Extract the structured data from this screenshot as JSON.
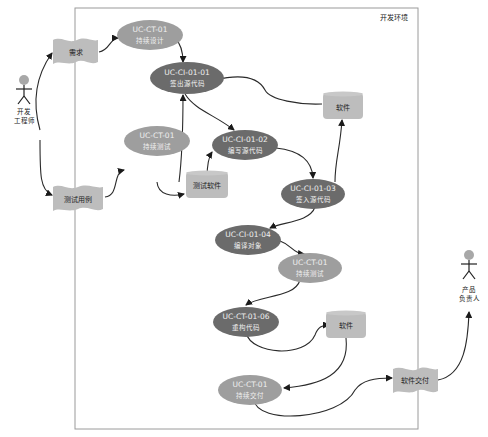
{
  "environment_label": "开发环境",
  "colors": {
    "dark_node": "#6b6b6b",
    "light_node": "#9e9e9e",
    "artifact": "#bdbdbd",
    "actor_head": "#a8a8a8",
    "frame": "#9a9a9a"
  },
  "actors": [
    {
      "id": "dev",
      "line1": "开发",
      "line2": "工程师"
    },
    {
      "id": "po",
      "line1": "产品",
      "line2": "负责人"
    }
  ],
  "documents": [
    {
      "id": "req",
      "label": "需求"
    },
    {
      "id": "testcase",
      "label": "测试用例"
    },
    {
      "id": "delivery",
      "label": "软件交付"
    }
  ],
  "artifacts": [
    {
      "id": "sw1",
      "label": "软件"
    },
    {
      "id": "testsw",
      "label": "测试软件"
    },
    {
      "id": "sw2",
      "label": "软件"
    }
  ],
  "use_cases": [
    {
      "id": "ct_design",
      "code": "UC-CT-01",
      "name": "持续设计"
    },
    {
      "id": "ci_checkout",
      "code": "UC-CI-01-01",
      "name": "签出源代码"
    },
    {
      "id": "ct_test1",
      "code": "UC-CT-01",
      "name": "持续测试"
    },
    {
      "id": "ci_write",
      "code": "UC-CI-01-02",
      "name": "编写源代码"
    },
    {
      "id": "ci_checkin",
      "code": "UC-CI-01-03",
      "name": "签入源代码"
    },
    {
      "id": "ci_compile",
      "code": "UC-CI-01-04",
      "name": "编译对象"
    },
    {
      "id": "ct_test2",
      "code": "UC-CT-01",
      "name": "持续测试"
    },
    {
      "id": "ct_refactor",
      "code": "UC-CT-01-06",
      "name": "重构代码"
    },
    {
      "id": "ct_deliver",
      "code": "UC-CT-01",
      "name": "持续交付"
    }
  ]
}
